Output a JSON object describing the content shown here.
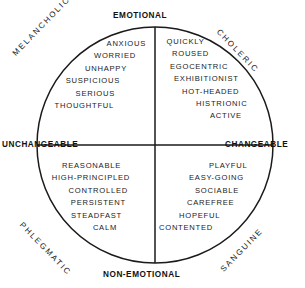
{
  "diagram": {
    "center": {
      "x": 155,
      "y": 145
    },
    "radius": 118,
    "stroke_color": "#1a1a1a",
    "background_color": "#ffffff"
  },
  "axes": {
    "vertical": {
      "top_label": "EMOTIONAL",
      "bottom_label": "NON-EMOTIONAL"
    },
    "horizontal": {
      "left_label": "UNCHANGEABLE",
      "right_label": "CHANGEABLE"
    }
  },
  "quadrants": [
    {
      "id": "melancholic",
      "temperament": "MELANCHOLIC",
      "position": "top-left",
      "traits": [
        "ANXIOUS",
        "WORRIED",
        "UNHAPPY",
        "SUSPICIOUS",
        "SERIOUS",
        "THOUGHTFUL"
      ]
    },
    {
      "id": "choleric",
      "temperament": "CHOLERIC",
      "position": "top-right",
      "traits": [
        "QUICKLY",
        "ROUSED",
        "EGOCENTRIC",
        "EXHIBITIONIST",
        "HOT-HEADED",
        "HISTRIONIC",
        "ACTIVE"
      ]
    },
    {
      "id": "phlegmatic",
      "temperament": "PHLEGMATIC",
      "position": "bottom-left",
      "traits": [
        "REASONABLE",
        "HIGH-PRINCIPLED",
        "CONTROLLED",
        "PERSISTENT",
        "STEADFAST",
        "CALM"
      ]
    },
    {
      "id": "sanguine",
      "temperament": "SANGUINE",
      "position": "bottom-right",
      "traits": [
        "PLAYFUL",
        "EASY-GOING",
        "SOCIABLE",
        "CAREFREE",
        "HOPEFUL",
        "CONTENTED"
      ]
    }
  ]
}
